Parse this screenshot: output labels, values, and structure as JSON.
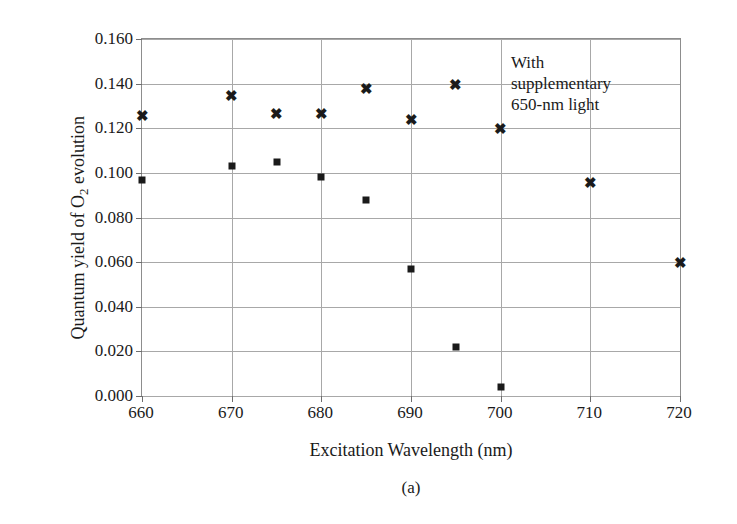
{
  "chart_data": {
    "type": "scatter",
    "title": "",
    "xlabel": "Excitation Wavelength (nm)",
    "ylabel": "Quantum yield of O2 evolution",
    "xlim": [
      660,
      720
    ],
    "ylim": [
      0.0,
      0.16
    ],
    "xticks": [
      660,
      670,
      680,
      690,
      700,
      710,
      720
    ],
    "xtick_labels": [
      "660",
      "670",
      "680",
      "690",
      "700",
      "710",
      "720"
    ],
    "yticks": [
      0.0,
      0.02,
      0.04,
      0.06,
      0.08,
      0.1,
      0.12,
      0.14,
      0.16
    ],
    "ytick_labels": [
      "0.000",
      "0.020",
      "0.040",
      "0.060",
      "0.080",
      "0.100",
      "0.120",
      "0.140",
      "0.160"
    ],
    "grid": true,
    "legend": "none",
    "annotations": [
      {
        "text": "With\nsupplementary\n650-nm light",
        "x": 703,
        "y": 0.152
      }
    ],
    "series": [
      {
        "name": "With supplementary 650-nm light",
        "marker": "x",
        "color": "#1a1a1a",
        "points": [
          {
            "x": 660,
            "y": 0.126
          },
          {
            "x": 670,
            "y": 0.135
          },
          {
            "x": 675,
            "y": 0.127
          },
          {
            "x": 680,
            "y": 0.127
          },
          {
            "x": 685,
            "y": 0.138
          },
          {
            "x": 690,
            "y": 0.124
          },
          {
            "x": 695,
            "y": 0.14
          },
          {
            "x": 700,
            "y": 0.12
          },
          {
            "x": 710,
            "y": 0.096
          },
          {
            "x": 720,
            "y": 0.06
          }
        ]
      },
      {
        "name": "Without supplementary light",
        "marker": "square",
        "color": "#1a1a1a",
        "points": [
          {
            "x": 660,
            "y": 0.097
          },
          {
            "x": 670,
            "y": 0.103
          },
          {
            "x": 675,
            "y": 0.105
          },
          {
            "x": 680,
            "y": 0.098
          },
          {
            "x": 685,
            "y": 0.088
          },
          {
            "x": 690,
            "y": 0.057
          },
          {
            "x": 695,
            "y": 0.022
          },
          {
            "x": 700,
            "y": 0.004
          }
        ]
      }
    ]
  },
  "caption": "(a)",
  "axis_title_y_prefix": "Quantum yield of O",
  "axis_title_y_subscript": "2",
  "axis_title_y_suffix": " evolution"
}
